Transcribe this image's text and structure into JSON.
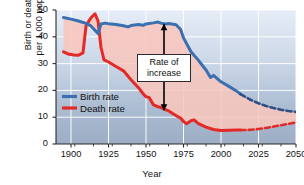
{
  "chart_data": {
    "type": "line",
    "title": "",
    "xlabel": "Year",
    "ylabel": "Birth or death rate per 1,000 population",
    "ylabel_line1": "Birth or death rate",
    "ylabel_line2": "per 1,000 population",
    "xlim": [
      1890,
      2050
    ],
    "ylim": [
      0,
      50
    ],
    "xticks": [
      1900,
      1925,
      1950,
      1975,
      2000,
      2025,
      2050
    ],
    "yticks": [
      0,
      10,
      20,
      30,
      40,
      50
    ],
    "xtick_labels": [
      "1900",
      "1925",
      "1950",
      "1975",
      "2000",
      "2025",
      "2050"
    ],
    "ytick_labels": [
      "0",
      "10",
      "20",
      "30",
      "40",
      "50"
    ],
    "minor_xtick_step": 12.5,
    "grid": true,
    "grid_color": "#ffffff",
    "plot_bg_top": "#e4ecf6",
    "plot_bg_bottom": "#9fb0c6",
    "fill_between_color": "#f9c9c0",
    "legend_position": "lower-left-inside",
    "projection_starts": 2013,
    "series": [
      {
        "name": "Birth rate",
        "color": "#3a6fb0",
        "style": "solid-then-dashed",
        "x": [
          1895,
          1900,
          1905,
          1910,
          1913,
          1915,
          1918,
          1920,
          1923,
          1925,
          1930,
          1935,
          1938,
          1940,
          1945,
          1948,
          1950,
          1955,
          1958,
          1960,
          1963,
          1965,
          1968,
          1970,
          1973,
          1975,
          1978,
          1980,
          1985,
          1988,
          1990,
          1993,
          1995,
          2000,
          2005,
          2010,
          2013
        ],
        "y": [
          47.2,
          46.6,
          45.9,
          45.0,
          44.2,
          43.0,
          41.2,
          44.8,
          45.1,
          44.9,
          44.6,
          44.1,
          43.7,
          44.2,
          44.6,
          44.3,
          44.8,
          45.2,
          45.5,
          45.1,
          44.8,
          45.0,
          44.7,
          44.5,
          42.8,
          39.6,
          36.5,
          34.4,
          31.2,
          29.0,
          27.6,
          24.8,
          25.6,
          23.2,
          21.6,
          19.9,
          18.6
        ],
        "x_proj": [
          2013,
          2020,
          2025,
          2030,
          2035,
          2040,
          2045,
          2050
        ],
        "y_proj": [
          18.6,
          16.4,
          15.2,
          14.2,
          13.4,
          12.8,
          12.3,
          12.0
        ]
      },
      {
        "name": "Death rate",
        "color": "#e42a28",
        "style": "solid-then-dashed",
        "x": [
          1895,
          1898,
          1902,
          1905,
          1908,
          1910,
          1912,
          1914,
          1916,
          1918,
          1920,
          1922,
          1925,
          1928,
          1930,
          1935,
          1940,
          1945,
          1948,
          1950,
          1952,
          1955,
          1958,
          1960,
          1965,
          1968,
          1970,
          1973,
          1975,
          1977,
          1980,
          1982,
          1985,
          1990,
          1995,
          2000,
          2005,
          2010,
          2013
        ],
        "y": [
          34.4,
          33.6,
          33.2,
          33.1,
          34.0,
          44.0,
          46.0,
          47.5,
          48.6,
          46.0,
          36.0,
          31.4,
          30.6,
          29.6,
          28.9,
          27.3,
          24.0,
          21.0,
          18.8,
          17.6,
          17.4,
          14.6,
          13.9,
          13.6,
          12.4,
          11.3,
          10.6,
          9.7,
          8.4,
          7.6,
          8.7,
          9.0,
          7.6,
          6.3,
          5.4,
          5.0,
          5.1,
          5.2,
          5.2
        ],
        "x_proj": [
          2013,
          2020,
          2025,
          2030,
          2035,
          2040,
          2045,
          2050
        ],
        "y_proj": [
          5.2,
          5.3,
          5.6,
          6.0,
          6.5,
          7.0,
          7.5,
          8.1
        ]
      }
    ],
    "annotations": [
      {
        "name": "rate-of-increase",
        "text_line1": "Rate of",
        "text_line2": "increase",
        "x": 1962,
        "y_top": 44.7,
        "y_bottom": 12.6,
        "arrow": "double-headed-vertical",
        "arrow_color": "#000000"
      }
    ]
  },
  "legend": {
    "items": [
      {
        "label": "Birth rate",
        "color": "#3a6fb0"
      },
      {
        "label": "Death rate",
        "color": "#e42a28"
      }
    ]
  }
}
